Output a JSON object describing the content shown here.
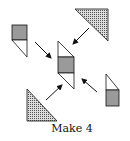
{
  "caption": "Make 4",
  "colors": {
    "square_fill": "#9a9a9a",
    "dotted_fill_base": "#d8d8d8",
    "dotted_dot": "#555555",
    "stroke": "#111111"
  },
  "pieces": [
    {
      "name": "top-left-unit",
      "parts": [
        "gray-square",
        "white-triangle"
      ]
    },
    {
      "name": "top-right-triangle",
      "parts": [
        "dotted-triangle"
      ]
    },
    {
      "name": "center-assembled-block",
      "parts": [
        "white-triangle-top",
        "gray-square",
        "white-triangle-bottom"
      ]
    },
    {
      "name": "right-unit",
      "parts": [
        "white-triangle",
        "gray-square"
      ]
    },
    {
      "name": "bottom-left-triangle",
      "parts": [
        "dotted-triangle"
      ]
    }
  ],
  "arrows": [
    {
      "from": "top-left-unit",
      "to": "center"
    },
    {
      "from": "top-right-triangle",
      "to": "center"
    },
    {
      "from": "right-unit",
      "to": "center"
    },
    {
      "from": "bottom-left-triangle",
      "to": "center"
    }
  ]
}
